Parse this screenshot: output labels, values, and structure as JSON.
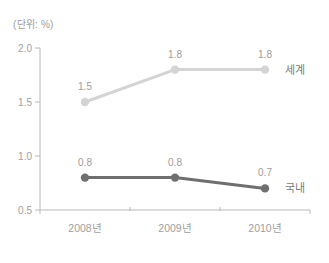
{
  "chart_data": {
    "type": "line",
    "unit_label": "(단위: %)",
    "categories": [
      "2008년",
      "2009년",
      "2010년"
    ],
    "series": [
      {
        "name": "세계",
        "values": [
          1.5,
          1.8,
          1.8
        ],
        "color": "#d4d4d4",
        "label_color": "#7d7d7d"
      },
      {
        "name": "국내",
        "values": [
          0.8,
          0.8,
          0.7
        ],
        "color": "#6f6f6f",
        "label_color": "#7d7d7d"
      }
    ],
    "y_ticks": [
      0.5,
      1.0,
      1.5,
      2.0
    ],
    "ylim": [
      0.5,
      2.0
    ],
    "grid": false,
    "legend_position": "right-of-last-point",
    "colors": {
      "axis": "#b8b8b8",
      "tick_label": "#9e9e9e",
      "data_label": "#9c9c9c"
    }
  }
}
